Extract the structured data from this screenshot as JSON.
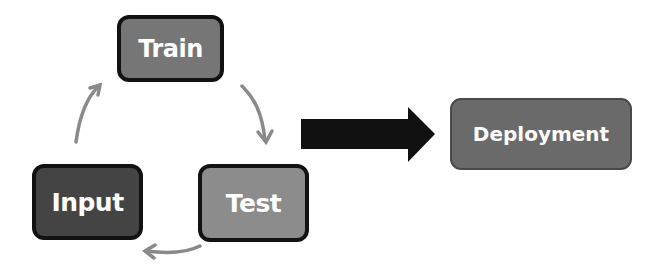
{
  "diagram": {
    "type": "flowchart",
    "nodes": [
      {
        "id": "train",
        "label": "Train",
        "fill": "#767676"
      },
      {
        "id": "test",
        "label": "Test",
        "fill": "#8c8c8c"
      },
      {
        "id": "input",
        "label": "Input",
        "fill": "#444444"
      },
      {
        "id": "deployment",
        "label": "Deployment",
        "fill": "#6a6a6a"
      }
    ],
    "edges": [
      {
        "from": "input",
        "to": "train",
        "style": "curved-thin",
        "color": "#8a8a8a"
      },
      {
        "from": "train",
        "to": "test",
        "style": "curved-thin",
        "color": "#8a8a8a"
      },
      {
        "from": "test",
        "to": "input",
        "style": "curved-thin",
        "color": "#8a8a8a"
      },
      {
        "from": "cycle",
        "to": "deployment",
        "style": "block-arrow",
        "color": "#111111"
      }
    ]
  },
  "labels": {
    "train": "Train",
    "test": "Test",
    "input": "Input",
    "deployment": "Deployment"
  }
}
